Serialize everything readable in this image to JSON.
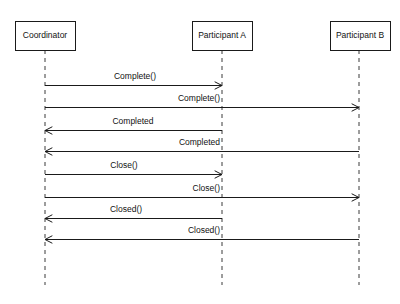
{
  "diagram": {
    "type": "uml-sequence-diagram",
    "title": "",
    "colors": {
      "background": "#ffffff",
      "box_stroke": "#1a1a1a",
      "box_fill": "#ffffff",
      "lifeline_stroke": "#3a3a3a",
      "message_stroke": "#1a1a1a",
      "text": "#111111"
    },
    "participants": [
      {
        "id": "coordinator",
        "label": "Coordinator",
        "x": 45,
        "box_left": 15,
        "box_top": 21,
        "box_width": 60,
        "box_height": 29,
        "lifeline_bottom": 285
      },
      {
        "id": "participant-a",
        "label": "Participant A",
        "x": 222,
        "box_left": 192,
        "box_top": 21,
        "box_width": 60,
        "box_height": 29,
        "lifeline_bottom": 285
      },
      {
        "id": "participant-b",
        "label": "Participant B",
        "x": 359,
        "box_left": 330,
        "box_top": 21,
        "box_width": 60,
        "box_height": 29,
        "lifeline_bottom": 285
      }
    ],
    "messages": [
      {
        "id": "msg-1",
        "label": "Complete()",
        "from": "coordinator",
        "to": "participant-a",
        "direction": "right",
        "y": 85,
        "x1": 45,
        "x2": 222,
        "label_x": 135,
        "label_y": 79,
        "label_anchor": "center"
      },
      {
        "id": "msg-2",
        "label": "Complete()",
        "from": "coordinator",
        "to": "participant-b",
        "direction": "right",
        "y": 107,
        "x1": 45,
        "x2": 359,
        "label_x": 220,
        "label_y": 101,
        "label_anchor": "end"
      },
      {
        "id": "msg-3",
        "label": "Completed",
        "from": "participant-a",
        "to": "coordinator",
        "direction": "left",
        "y": 130,
        "x1": 222,
        "x2": 45,
        "label_x": 133,
        "label_y": 124,
        "label_anchor": "center"
      },
      {
        "id": "msg-4",
        "label": "Completed",
        "from": "participant-b",
        "to": "coordinator",
        "direction": "left",
        "y": 151,
        "x1": 359,
        "x2": 45,
        "label_x": 220,
        "label_y": 145,
        "label_anchor": "end"
      },
      {
        "id": "msg-5",
        "label": "Close()",
        "from": "coordinator",
        "to": "participant-a",
        "direction": "right",
        "y": 174,
        "x1": 45,
        "x2": 222,
        "label_x": 124,
        "label_y": 168,
        "label_anchor": "center"
      },
      {
        "id": "msg-6",
        "label": "Close()",
        "from": "coordinator",
        "to": "participant-b",
        "direction": "right",
        "y": 197,
        "x1": 45,
        "x2": 359,
        "label_x": 220,
        "label_y": 191,
        "label_anchor": "end"
      },
      {
        "id": "msg-7",
        "label": "Closed()",
        "from": "participant-a",
        "to": "coordinator",
        "direction": "left",
        "y": 218,
        "x1": 222,
        "x2": 45,
        "label_x": 126,
        "label_y": 212,
        "label_anchor": "center"
      },
      {
        "id": "msg-8",
        "label": "Closed()",
        "from": "participant-b",
        "to": "coordinator",
        "direction": "left",
        "y": 239,
        "x1": 359,
        "x2": 45,
        "label_x": 220,
        "label_y": 233,
        "label_anchor": "end"
      }
    ]
  }
}
